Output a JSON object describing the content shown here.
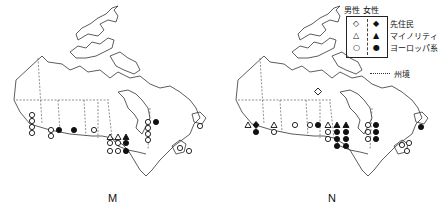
{
  "figure": {
    "panels": [
      {
        "id": "M",
        "caption": "M"
      },
      {
        "id": "N",
        "caption": "N"
      }
    ]
  },
  "legend": {
    "header_male": "男性",
    "header_female": "女性",
    "rows": [
      {
        "label": "先住民",
        "male_symbol": "◇",
        "female_symbol": "◆"
      },
      {
        "label": "マイノリティ",
        "male_symbol": "△",
        "female_symbol": "▲"
      },
      {
        "label": "ヨーロッパ系",
        "male_symbol": "○",
        "female_symbol": "●"
      }
    ],
    "border_label": "州境"
  },
  "map_data": {
    "M": {
      "british_columbia": {
        "male_european": 4
      },
      "alberta": {
        "male_european": 2,
        "female_european": 1
      },
      "saskatchewan": {
        "female_european": 1
      },
      "manitoba": {
        "male_european": 1
      },
      "ontario": {
        "male_minority": 2,
        "female_minority": 1,
        "male_european": 4,
        "female_european": 2
      },
      "quebec": {
        "male_european": 4,
        "female_european": 1
      },
      "newfoundland": {
        "male_european": 1
      },
      "maritimes": {
        "male_european": 2
      }
    },
    "N": {
      "british_columbia": {
        "male_minority": 1,
        "female_indigenous": 1,
        "female_european": 1
      },
      "alberta": {
        "male_minority": 1,
        "male_european": 1
      },
      "saskatchewan": {
        "male_european": 1
      },
      "manitoba": {
        "male_european": 1,
        "female_european": 1
      },
      "nunavut": {
        "male_indigenous": 1
      },
      "ontario": {
        "male_minority": 1,
        "female_minority": 2,
        "male_european": 2,
        "female_european": 6
      },
      "quebec": {
        "male_european": 3,
        "female_european": 3
      },
      "newfoundland": {
        "female_european": 1
      },
      "maritimes": {
        "male_european": 3
      }
    }
  }
}
